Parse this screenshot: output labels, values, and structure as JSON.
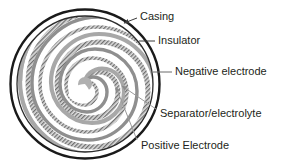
{
  "figure": {
    "name": "cylindrical-battery-cross-section",
    "background_color": "#ffffff",
    "text_color": "#231f20"
  },
  "colors": {
    "casing_stroke": "#1a1a1a",
    "insulator_stroke": "#2b2b2b",
    "electrode_gray": "#a8a8a8",
    "electrode_dark_gray": "#8f8f8f",
    "separator_hatch": "#6e6e6e",
    "separator_base": "#dcdcdc",
    "core_fill": "#b0b0b0",
    "void_fill": "#ffffff",
    "leader_line": "#4d4d4d",
    "arrow_line": "#9a9a9a"
  },
  "geometry": {
    "cell_center_x": 85,
    "cell_center_y": 84,
    "casing_radius": 75,
    "insulator_radius": 68,
    "core_radius": 7,
    "spiral_turns": 6
  },
  "labels": [
    {
      "id": "casing",
      "text": "Casing",
      "text_x": 140,
      "text_y": 17,
      "leader": {
        "x1": 137,
        "y1": 18,
        "x2": 122,
        "y2": 22
      },
      "pointer": "arrow"
    },
    {
      "id": "insulator",
      "text": "Insulator",
      "text_x": 158,
      "text_y": 41,
      "leader": {
        "x1": 155,
        "y1": 41,
        "x2": 139,
        "y2": 41
      },
      "pointer": "line"
    },
    {
      "id": "negative-electrode",
      "text": "Negative electrode",
      "text_x": 175,
      "text_y": 72,
      "leader": {
        "x1": 172,
        "y1": 72,
        "x2": 152,
        "y2": 72
      },
      "pointer": "line"
    },
    {
      "id": "separator-electrolyte",
      "text": "Separator/electrolyte",
      "text_x": 160,
      "text_y": 114,
      "leader": {
        "x1": 157,
        "y1": 110,
        "x2": 122,
        "y2": 86
      },
      "pointer": "arrow"
    },
    {
      "id": "positive-electrode",
      "text": "Positive Electrode",
      "text_x": 141,
      "text_y": 146,
      "leader": {
        "x1": 138,
        "y1": 141,
        "x2": 116,
        "y2": 87
      },
      "pointer": "arrow"
    }
  ]
}
